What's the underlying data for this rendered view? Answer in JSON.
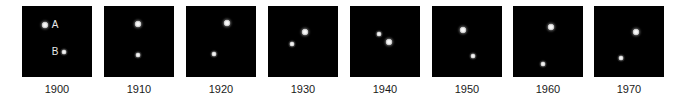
{
  "figure": {
    "panels": [
      {
        "year": "1900",
        "star_a": {
          "x": 23,
          "y": 19
        },
        "star_b": {
          "x": 42,
          "y": 46
        },
        "label_a": "A",
        "label_b": "B"
      },
      {
        "year": "1910",
        "star_a": {
          "x": 34,
          "y": 18
        },
        "star_b": {
          "x": 34,
          "y": 49
        }
      },
      {
        "year": "1920",
        "star_a": {
          "x": 41,
          "y": 17
        },
        "star_b": {
          "x": 28,
          "y": 48
        }
      },
      {
        "year": "1930",
        "star_a": {
          "x": 37,
          "y": 26
        },
        "star_b": {
          "x": 24,
          "y": 38
        }
      },
      {
        "year": "1940",
        "star_a": {
          "x": 39,
          "y": 36
        },
        "star_b": {
          "x": 29,
          "y": 28
        }
      },
      {
        "year": "1950",
        "star_a": {
          "x": 31,
          "y": 24
        },
        "star_b": {
          "x": 41,
          "y": 50
        }
      },
      {
        "year": "1960",
        "star_a": {
          "x": 38,
          "y": 21
        },
        "star_b": {
          "x": 30,
          "y": 58
        }
      },
      {
        "year": "1970",
        "star_a": {
          "x": 42,
          "y": 26
        },
        "star_b": {
          "x": 27,
          "y": 52
        }
      }
    ],
    "panel_left_offsets": [
      22,
      104,
      186,
      268,
      350,
      432,
      513,
      594
    ],
    "colors": {
      "panel_background": "#000000",
      "star": "#ffffff",
      "year_text": "#1a1a1a",
      "page_background": "#ffffff"
    }
  }
}
